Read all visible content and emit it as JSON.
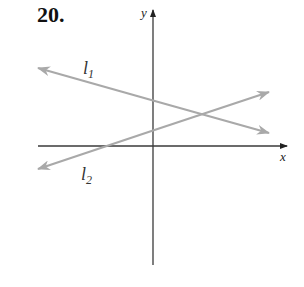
{
  "problem": {
    "number": "20."
  },
  "axes": {
    "x_label": "x",
    "y_label": "y",
    "color": "#3a3a3a"
  },
  "lines": [
    {
      "name": "l",
      "subscript": "1",
      "slope_sign": "negative",
      "color": "#a9a9a9"
    },
    {
      "name": "l",
      "subscript": "2",
      "slope_sign": "positive",
      "color": "#a9a9a9"
    }
  ]
}
